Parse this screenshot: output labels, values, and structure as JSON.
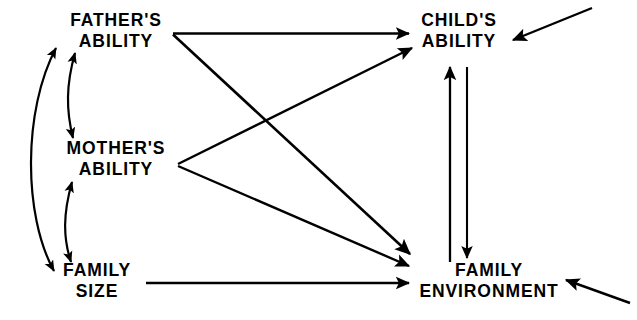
{
  "diagram": {
    "type": "path-diagram",
    "background_color": "#ffffff",
    "stroke_color": "#000000",
    "nodes": [
      {
        "id": "fathers_ability",
        "line1": "FATHER'S",
        "line2": "ABILITY",
        "x": 116,
        "y": 10
      },
      {
        "id": "mothers_ability",
        "line1": "MOTHER'S",
        "line2": "ABILITY",
        "x": 116,
        "y": 138
      },
      {
        "id": "family_size",
        "line1": "FAMILY",
        "line2": "SIZE",
        "x": 97,
        "y": 260
      },
      {
        "id": "childs_ability",
        "line1": "CHILD'S",
        "line2": "ABILITY",
        "x": 459,
        "y": 10
      },
      {
        "id": "family_environment",
        "line1": "FAMILY",
        "line2": "ENVIRONMENT",
        "x": 489,
        "y": 260
      }
    ],
    "edges": [
      {
        "id": "fathers-to-childs",
        "from": "fathers_ability",
        "to": "childs_ability",
        "style": "straight",
        "arrow": "single"
      },
      {
        "id": "fathers-to-family-environment",
        "from": "fathers_ability",
        "to": "family_environment",
        "style": "straight",
        "arrow": "single"
      },
      {
        "id": "mothers-to-childs",
        "from": "mothers_ability",
        "to": "childs_ability",
        "style": "straight",
        "arrow": "single"
      },
      {
        "id": "mothers-to-family-environment",
        "from": "mothers_ability",
        "to": "family_environment",
        "style": "straight",
        "arrow": "single"
      },
      {
        "id": "family-size-to-family-environment",
        "from": "family_size",
        "to": "family_environment",
        "style": "straight",
        "arrow": "single"
      },
      {
        "id": "family-environment-to-childs",
        "from": "family_environment",
        "to": "childs_ability",
        "style": "straight",
        "arrow": "single"
      },
      {
        "id": "childs-to-family-environment",
        "from": "childs_ability",
        "to": "family_environment",
        "style": "straight",
        "arrow": "single"
      },
      {
        "id": "fathers-mothers-correlation",
        "from": "fathers_ability",
        "to": "mothers_ability",
        "style": "curved",
        "arrow": "double"
      },
      {
        "id": "mothers-family-size-correlation",
        "from": "mothers_ability",
        "to": "family_size",
        "style": "curved",
        "arrow": "double"
      },
      {
        "id": "fathers-family-size-correlation",
        "from": "fathers_ability",
        "to": "family_size",
        "style": "curved",
        "arrow": "double"
      },
      {
        "id": "external-input-childs",
        "from": "external",
        "to": "childs_ability",
        "style": "straight",
        "arrow": "single"
      },
      {
        "id": "external-input-family-environment",
        "from": "external",
        "to": "family_environment",
        "style": "straight",
        "arrow": "single"
      }
    ]
  }
}
